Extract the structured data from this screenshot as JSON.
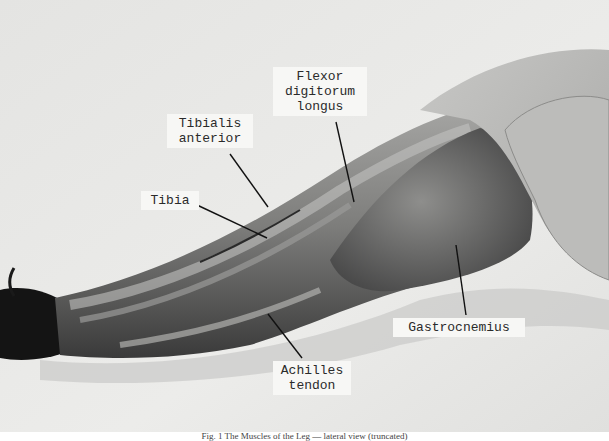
{
  "figure": {
    "labels": [
      {
        "id": "flexor-digitorum-longus",
        "text": "Flexor\ndigitorum\nlongus"
      },
      {
        "id": "tibialis-anterior",
        "text": "Tibialis\nanterior"
      },
      {
        "id": "tibia",
        "text": "Tibia"
      },
      {
        "id": "gastrocnemius",
        "text": "Gastrocnemius"
      },
      {
        "id": "achilles-tendon",
        "text": "Achilles\ntendon"
      }
    ],
    "caption": "Fig. 1 The Muscles of the Leg — lateral view (truncated)",
    "colors": {
      "background": "#e9e9e7",
      "tissue_light": "#bdbdbb",
      "tissue_mid": "#8a8a88",
      "tissue_dark": "#2b2b2b",
      "label_bg": "#f7f7f5",
      "leader_line": "#111111"
    }
  }
}
